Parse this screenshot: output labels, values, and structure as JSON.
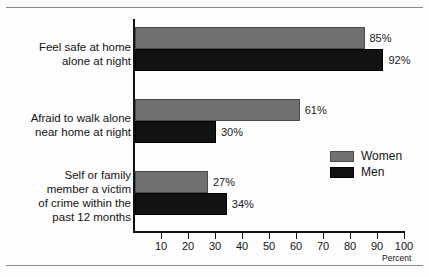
{
  "chart_data": {
    "type": "bar",
    "orientation": "horizontal",
    "title": "",
    "subtitle": "",
    "xlabel": "Percent",
    "ylabel": "",
    "xlim": [
      0,
      100
    ],
    "xticks": [
      10,
      20,
      30,
      40,
      50,
      60,
      70,
      80,
      90,
      100
    ],
    "xtick_labels": [
      "10",
      "20",
      "30",
      "40",
      "50",
      "60",
      "70",
      "80",
      "90",
      "100"
    ],
    "grid": false,
    "legend_position": "right-middle",
    "categories": [
      "Feel safe at home alone at night",
      "Afraid to walk alone near home at night",
      "Self or family member a victim of crime within the past 12 months"
    ],
    "category_label_lines": [
      [
        "Feel safe at home",
        "alone at night"
      ],
      [
        "Afraid to walk alone",
        "near home at night"
      ],
      [
        "Self or family",
        "member a victim",
        "of crime within the",
        "past 12 months"
      ]
    ],
    "series": [
      {
        "name": "Women",
        "color": "#717171",
        "values": [
          85,
          61,
          27
        ],
        "data_labels": [
          "85%",
          "61%",
          "27%"
        ]
      },
      {
        "name": "Men",
        "color": "#121212",
        "values": [
          92,
          30,
          34
        ],
        "data_labels": [
          "92%",
          "30%",
          "34%"
        ]
      }
    ]
  },
  "legend": {
    "entries": [
      {
        "label": "Women",
        "swatch": "women-swatch"
      },
      {
        "label": "Men",
        "swatch": "men-swatch"
      }
    ]
  },
  "axis": {
    "percent_label": "Percent"
  },
  "colors": {
    "women": "#717171",
    "men": "#121212",
    "axis": "#111111",
    "rule": "#8a8a8a",
    "text": "#141414",
    "background": "#fdfdfd"
  }
}
